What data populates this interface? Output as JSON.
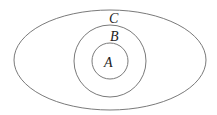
{
  "diagram": {
    "type": "nested-sets",
    "sets": [
      {
        "label": "C",
        "shape": "ellipse",
        "cx": 110,
        "cy": 60,
        "rx": 96,
        "ry": 50,
        "label_x": 109,
        "label_y": 23
      },
      {
        "label": "B",
        "shape": "circle",
        "cx": 110,
        "cy": 61,
        "r": 36,
        "label_x": 110,
        "label_y": 40
      },
      {
        "label": "A",
        "shape": "circle",
        "cx": 110,
        "cy": 61,
        "r": 18,
        "label_x": 104,
        "label_y": 66
      }
    ],
    "relation": "A ⊂ B ⊂ C"
  },
  "labels": {
    "outer": "C",
    "middle": "B",
    "inner": "A"
  }
}
